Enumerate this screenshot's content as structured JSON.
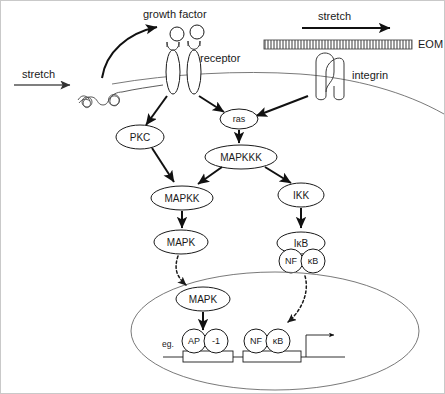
{
  "figure": {
    "background_color": "#ffffff",
    "line_color": "#1a1a1a"
  },
  "labels": {
    "stretch_left": "stretch",
    "stretch_right": "stretch",
    "growth_factor": "growth factor",
    "receptor": "receptor",
    "eom": "EOM",
    "integrin": "integrin",
    "eg": "eg."
  },
  "nodes": {
    "pkc": "PKC",
    "ras": "ras",
    "mapkkk": "MAPKKK",
    "mapkk": "MAPKK",
    "mapk_cyto": "MAPK",
    "ikk": "IKK",
    "ikb": "IκB",
    "nf_cyto": "NF",
    "kb_cyto": "κB",
    "mapk_nuc": "MAPK",
    "ap": "AP",
    "ap_one": "-1",
    "nf_nuc": "NF",
    "kb_nuc": "κB"
  },
  "structures": {
    "plasma_membrane": "plasma-membrane-curve",
    "nucleus": "nuclear-envelope",
    "eom_band": "extracellular-matrix-band",
    "receptor_dimer": "growth-factor-receptor-dimer",
    "integrin_dimer": "integrin-dimer",
    "coiled_protein": "stretch-sensitive-coiled-protein",
    "dna_strand": "dna-promoter-strand",
    "transcription_start": "transcription-start-arrow"
  },
  "edges": [
    {
      "from": "stretch_left",
      "to": "coiled_protein",
      "style": "solid"
    },
    {
      "from": "coiled_protein",
      "to": "growth_factor",
      "style": "curved"
    },
    {
      "from": "receptor",
      "to": "pkc",
      "style": "solid"
    },
    {
      "from": "receptor",
      "to": "ras",
      "style": "solid"
    },
    {
      "from": "integrin",
      "to": "ras",
      "style": "solid"
    },
    {
      "from": "pkc",
      "to": "mapkk",
      "style": "solid"
    },
    {
      "from": "ras",
      "to": "mapkkk",
      "style": "solid"
    },
    {
      "from": "mapkkk",
      "to": "mapkk",
      "style": "solid"
    },
    {
      "from": "mapkkk",
      "to": "ikk",
      "style": "solid"
    },
    {
      "from": "mapkk",
      "to": "mapk_cyto",
      "style": "solid"
    },
    {
      "from": "ikk",
      "to": "ikb",
      "style": "solid"
    },
    {
      "from": "mapk_cyto",
      "to": "mapk_nuc",
      "style": "dotted"
    },
    {
      "from": "nf_cyto",
      "to": "nf_nuc",
      "style": "dotted"
    },
    {
      "from": "mapk_nuc",
      "to": "ap",
      "style": "solid"
    }
  ]
}
